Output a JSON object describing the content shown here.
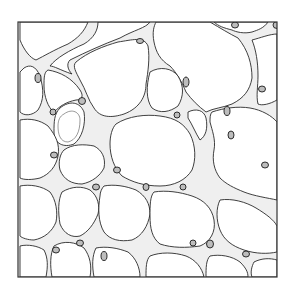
{
  "figure": {
    "colors": {
      "background": "#ffffff",
      "ink": "#2a2a2a",
      "wall_fill": "#efefef",
      "nucleus_fill": "#bdbdbd"
    },
    "frame": {
      "x": 18,
      "y": 22,
      "width": 259,
      "height": 255
    }
  }
}
